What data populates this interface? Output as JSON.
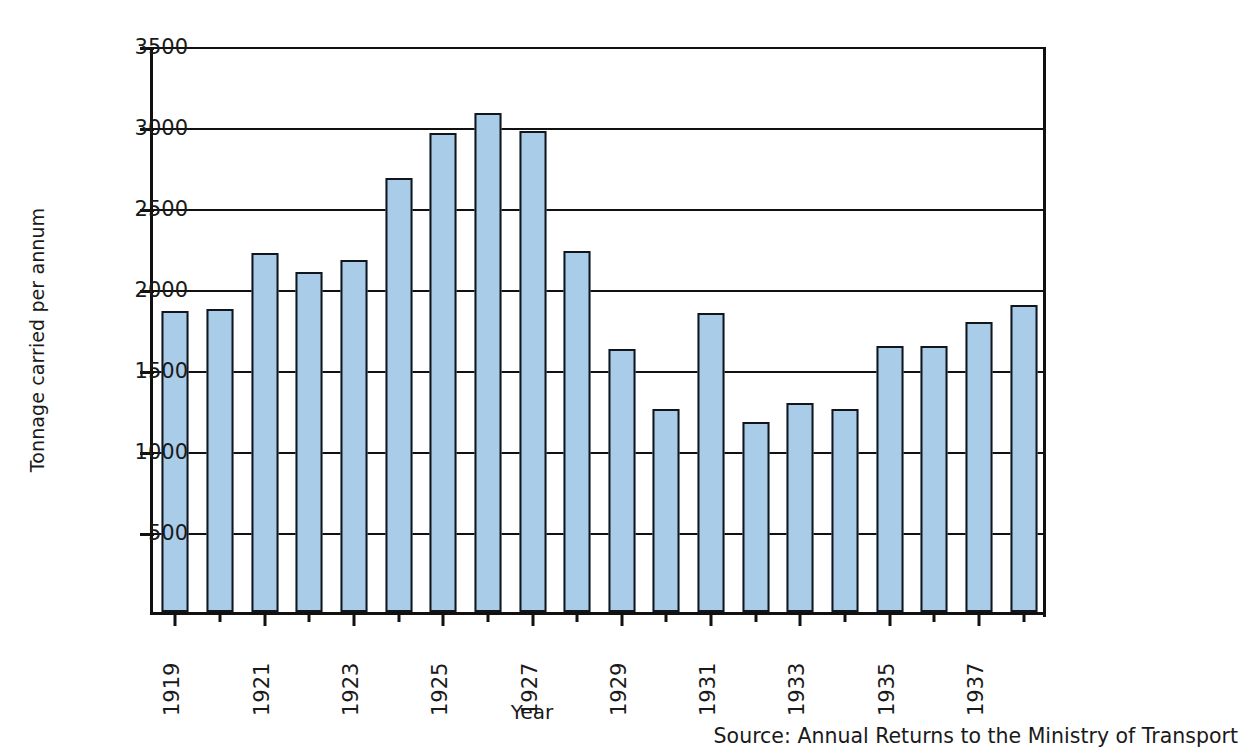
{
  "chart_data": {
    "type": "bar",
    "title": "",
    "xlabel": "Year",
    "ylabel": "Tonnage carried per annum",
    "categories": [
      1919,
      1920,
      1921,
      1922,
      1923,
      1924,
      1925,
      1926,
      1927,
      1928,
      1929,
      1930,
      1931,
      1932,
      1933,
      1934,
      1935,
      1936,
      1937,
      1938
    ],
    "values": [
      1860,
      1868,
      2215,
      2100,
      2170,
      2680,
      2958,
      3078,
      2968,
      2230,
      1625,
      1255,
      1848,
      1175,
      1288,
      1252,
      1640,
      1640,
      1790,
      1895
    ],
    "ylim": [
      0,
      3500
    ],
    "yticks": [
      500,
      1000,
      1500,
      2000,
      2500,
      3000,
      3500
    ],
    "ytick_labels": [
      "500",
      "1000",
      "1500",
      "2000",
      "2500",
      "3000",
      "3500"
    ],
    "xtick_labels": [
      "1919",
      "",
      "1921",
      "",
      "1923",
      "",
      "1925",
      "",
      "1927",
      "",
      "1929",
      "",
      "1931",
      "",
      "1933",
      "",
      "1935",
      "",
      "1937",
      ""
    ],
    "grid": true,
    "legend": false,
    "bar_color": "#a9cce9",
    "bar_edge_color": "#12161c",
    "axis_color": "#111111"
  },
  "source_note": "Source: Annual Returns to the Ministry of Transport"
}
